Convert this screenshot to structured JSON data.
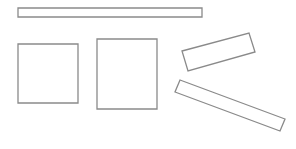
{
  "canvas": {
    "width": 296,
    "height": 149,
    "background": "#ffffff"
  },
  "style": {
    "stroke": "#8a8a8a",
    "stroke_width": 1.3,
    "fill": "#ffffff"
  },
  "shapes": [
    {
      "name": "horizontal-bar",
      "type": "polygon",
      "points": "18,8 202,8 202,17 18,17"
    },
    {
      "name": "square-left",
      "type": "polygon",
      "points": "18,44 78,44 78,103 18,103"
    },
    {
      "name": "rectangle-middle",
      "type": "polygon",
      "points": "97,39 157,39 157,109 97,109"
    },
    {
      "name": "tilted-rectangle-upper",
      "type": "polygon",
      "points": "182,51 249,33 255,52 188,71"
    },
    {
      "name": "tilted-rectangle-lower",
      "type": "polygon",
      "points": "180,80 285,119 280,131 175,92"
    }
  ]
}
